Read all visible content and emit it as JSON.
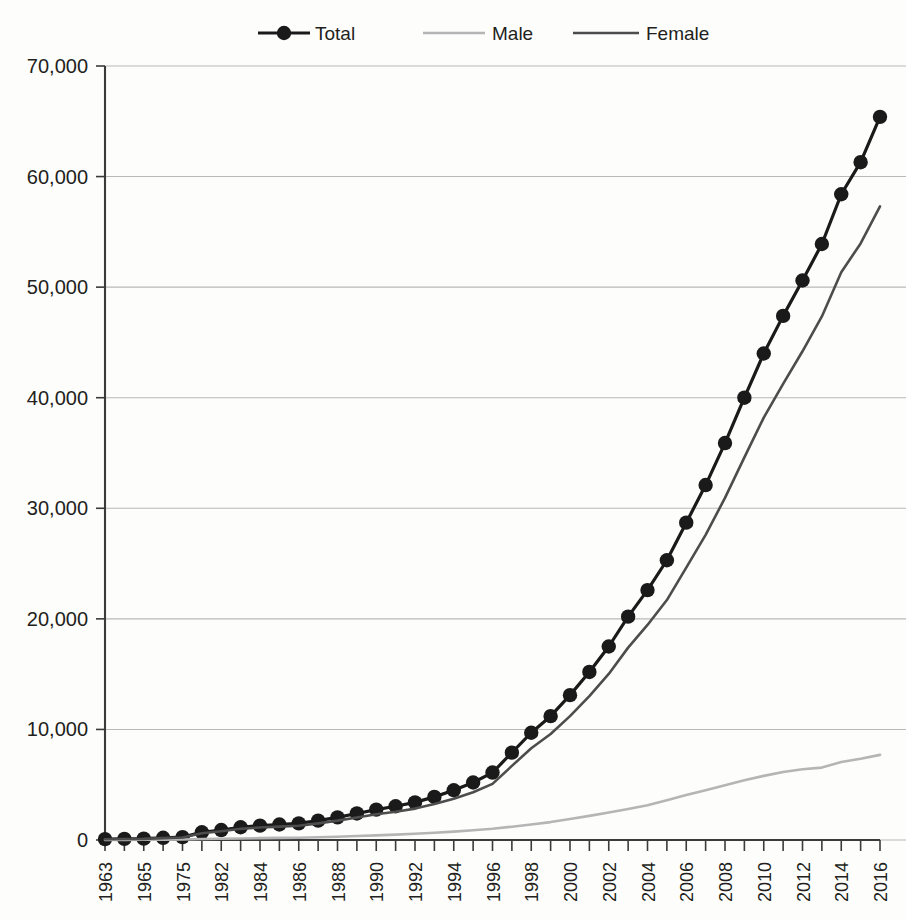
{
  "chart_data": {
    "type": "line",
    "title": "",
    "xlabel": "",
    "ylabel": "",
    "ylim": [
      0,
      70000
    ],
    "ytick_step": 10000,
    "grid": true,
    "legend_position": "top-center",
    "ytick_labels": [
      "70,000",
      "60,000",
      "50,000",
      "40,000",
      "30,000",
      "20,000",
      "10,000",
      "0"
    ],
    "ytick_values": [
      70000,
      60000,
      50000,
      40000,
      30000,
      20000,
      10000,
      0
    ],
    "categories": [
      "1963",
      "1964",
      "1965",
      "1974",
      "1975",
      "1981",
      "1982",
      "1983",
      "1984",
      "1985",
      "1986",
      "1987",
      "1988",
      "1989",
      "1990",
      "1991",
      "1992",
      "1993",
      "1994",
      "1995",
      "1996",
      "1997",
      "1998",
      "1999",
      "2000",
      "2001",
      "2002",
      "2003",
      "2004",
      "2005",
      "2006",
      "2007",
      "2008",
      "2009",
      "2010",
      "2011",
      "2012",
      "2013",
      "2014",
      "2015",
      "2016"
    ],
    "xtick_labels_shown": [
      "1963",
      "",
      "1965",
      "",
      "1975",
      "",
      "1982",
      "",
      "1984",
      "",
      "1986",
      "",
      "1988",
      "",
      "1990",
      "",
      "1992",
      "",
      "1994",
      "",
      "1996",
      "",
      "1998",
      "",
      "2000",
      "",
      "2002",
      "",
      "2004",
      "",
      "2006",
      "",
      "2008",
      "",
      "2010",
      "",
      "2012",
      "",
      "2014",
      "",
      "2016"
    ],
    "series": [
      {
        "name": "Total",
        "color": "#1a1a1a",
        "width": 3.2,
        "markers": true,
        "marker_size": 7.2,
        "values": [
          80,
          100,
          120,
          200,
          260,
          700,
          900,
          1150,
          1300,
          1400,
          1500,
          1750,
          2050,
          2400,
          2750,
          3050,
          3400,
          3900,
          4500,
          5200,
          6100,
          7900,
          9700,
          11200,
          13100,
          15200,
          17500,
          20200,
          22600,
          25300,
          28700,
          32100,
          35900,
          40000,
          44000,
          47400,
          50600,
          53900,
          58400,
          61300,
          65400
        ]
      },
      {
        "name": "Male",
        "color": "#b5b5b5",
        "width": 2.6,
        "markers": false,
        "marker_size": 0,
        "values": [
          10,
          15,
          20,
          30,
          40,
          90,
          110,
          140,
          170,
          190,
          210,
          250,
          300,
          360,
          420,
          490,
          560,
          650,
          760,
          880,
          1020,
          1200,
          1400,
          1620,
          1900,
          2180,
          2480,
          2800,
          3150,
          3600,
          4060,
          4500,
          4960,
          5400,
          5800,
          6150,
          6400,
          6550,
          7050,
          7350,
          7700
        ]
      },
      {
        "name": "Female",
        "color": "#4d4d4d",
        "width": 2.6,
        "markers": false,
        "marker_size": 0,
        "values": [
          70,
          85,
          100,
          170,
          220,
          610,
          790,
          1010,
          1130,
          1210,
          1290,
          1500,
          1750,
          2040,
          2330,
          2560,
          2840,
          3250,
          3740,
          4320,
          5080,
          6700,
          8300,
          9580,
          11200,
          13020,
          15020,
          17400,
          19450,
          21700,
          24640,
          27600,
          30940,
          34600,
          38200,
          41250,
          44200,
          47350,
          51350,
          53950,
          57300
        ]
      }
    ],
    "legend": [
      {
        "label": "Total",
        "color": "#1a1a1a",
        "marker": true
      },
      {
        "label": "Male",
        "color": "#b5b5b5",
        "marker": false
      },
      {
        "label": "Female",
        "color": "#4d4d4d",
        "marker": false
      }
    ]
  },
  "colors": {
    "background": "#fdfdfc",
    "gridline": "#b9b9b9",
    "axis": "#3b3b3b",
    "text": "#231f20"
  }
}
